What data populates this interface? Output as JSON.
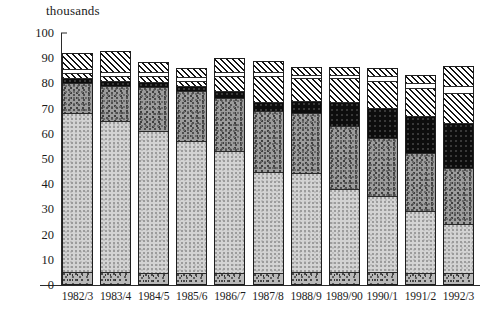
{
  "chart_data": {
    "type": "bar",
    "subtype": "stacked",
    "title": "",
    "subtitle": "",
    "unit_label": "thousands",
    "xlabel": "",
    "ylabel": "thousands",
    "ylim": [
      0,
      100
    ],
    "yticks": [
      0,
      10,
      20,
      30,
      40,
      50,
      60,
      70,
      80,
      90,
      100
    ],
    "ytick_labels": [
      "0",
      "10",
      "20",
      "30",
      "40",
      "50",
      "60",
      "70",
      "80",
      "90",
      "100"
    ],
    "grid": false,
    "legend": false,
    "legend_position": "none",
    "categories": [
      "1982/3",
      "1983/4",
      "1984/5",
      "1985/6",
      "1986/7",
      "1987/8",
      "1988/9",
      "1989/90",
      "1990/1",
      "1991/2",
      "1992/3"
    ],
    "series": [
      {
        "name": "segment-1-base",
        "fill": "dark-speckle",
        "values": [
          4.5,
          4.5,
          4.0,
          4.0,
          4.0,
          4.0,
          4.5,
          4.5,
          4.5,
          4.0,
          4.0
        ]
      },
      {
        "name": "segment-2-light-stipple",
        "fill": "light-stipple",
        "values": [
          63.5,
          60.5,
          57.0,
          53.0,
          49.0,
          40.5,
          39.5,
          33.0,
          30.5,
          25.0,
          19.5
        ]
      },
      {
        "name": "segment-3-medium-stipple",
        "fill": "medium-stipple",
        "values": [
          12.0,
          14.0,
          17.5,
          20.0,
          21.0,
          24.5,
          24.0,
          25.5,
          23.0,
          23.0,
          22.5
        ]
      },
      {
        "name": "segment-4-black",
        "fill": "solid-black",
        "values": [
          2.0,
          2.0,
          2.0,
          2.0,
          3.0,
          3.5,
          5.0,
          9.5,
          12.0,
          15.0,
          18.0
        ]
      },
      {
        "name": "segment-5-hatch",
        "fill": "diagonal-hatch",
        "values": [
          2.0,
          2.0,
          2.5,
          2.0,
          6.0,
          10.5,
          9.0,
          9.5,
          11.0,
          11.0,
          12.0
        ]
      },
      {
        "name": "segment-6-white",
        "fill": "white",
        "values": [
          1.5,
          1.5,
          1.5,
          1.5,
          1.5,
          1.5,
          1.5,
          1.5,
          2.0,
          2.0,
          3.0
        ]
      },
      {
        "name": "segment-7-top-hatch",
        "fill": "diagonal-hatch",
        "values": [
          6.5,
          8.5,
          4.0,
          3.5,
          5.5,
          4.5,
          3.0,
          3.0,
          3.0,
          3.5,
          8.0
        ]
      }
    ],
    "totals": [
      92.0,
      93.0,
      88.5,
      86.0,
      90.0,
      89.0,
      86.5,
      86.5,
      86.0,
      83.5,
      87.0
    ],
    "colors": {
      "base": "#b9b9b9",
      "light": "#d3d3d3",
      "medium": "#9c9c9c",
      "black": "#0d0d0d",
      "hatch": "#141414",
      "white": "#ffffff",
      "axis": "#2b2b2b",
      "outline": "#1e1e1e"
    }
  }
}
